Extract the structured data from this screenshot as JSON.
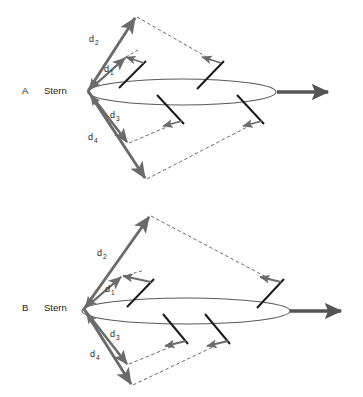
{
  "figure": {
    "background_color": "#ffffff",
    "width": 363,
    "height": 397,
    "colors": {
      "vector_gray": "#6b6b6b",
      "vortex_black": "#1a1a1a",
      "body_outline": "#5a5a5a",
      "dashed_gray": "#6b6b6b",
      "text": "#1a1a1a"
    }
  },
  "panels": [
    {
      "id": "A",
      "label": "A",
      "label_x": 22,
      "label_y": 94,
      "stern_label": "Stern",
      "stern_label_x": 44,
      "stern_label_y": 94,
      "stern_point": {
        "x": 88,
        "y": 91
      },
      "body": {
        "name": "fish-body-ellipse",
        "cx": 182,
        "cy": 92,
        "rx": 94,
        "ry": 13
      },
      "thrust_arrow": {
        "name": "thrust-arrow",
        "x1": 277,
        "y1": 92,
        "x2": 332,
        "y2": 92,
        "label": "thrust"
      },
      "distance_labels": [
        {
          "id": "d1",
          "base": "d",
          "sub": "1",
          "x": 104,
          "y": 72
        },
        {
          "id": "d2",
          "base": "d",
          "sub": "2",
          "x": 90,
          "y": 42
        },
        {
          "id": "d3",
          "base": "d",
          "sub": "3",
          "x": 110,
          "y": 118
        },
        {
          "id": "d4",
          "base": "d",
          "sub": "4",
          "x": 88,
          "y": 140
        }
      ],
      "vectors": [
        {
          "id": "d1",
          "name": "distance-vector-d1",
          "x1": 88,
          "y1": 91,
          "x2": 126,
          "y2": 57
        },
        {
          "id": "d2",
          "name": "distance-vector-d2",
          "x1": 88,
          "y1": 91,
          "x2": 136,
          "y2": 16
        },
        {
          "id": "d3",
          "name": "distance-vector-d3",
          "x1": 88,
          "y1": 91,
          "x2": 128,
          "y2": 143
        },
        {
          "id": "d4",
          "name": "distance-vector-d4",
          "x1": 88,
          "y1": 91,
          "x2": 146,
          "y2": 180
        }
      ],
      "vortex_rings": [
        {
          "id": "ring1",
          "name": "vortex-ring-upper-inner",
          "x1": 120,
          "y1": 87,
          "x2": 145,
          "y2": 63,
          "arrow_x1": 144,
          "arrow_y1": 63,
          "arrow_x2": 124,
          "arrow_y2": 57,
          "dash_x1": 126,
          "dash_y1": 57,
          "dash_x2": 136,
          "dash_y2": 51
        },
        {
          "id": "ring2",
          "name": "vortex-ring-upper-outer",
          "x1": 198,
          "y1": 88,
          "x2": 222,
          "y2": 62,
          "arrow_x1": 220,
          "arrow_y1": 63,
          "arrow_x2": 200,
          "arrow_y2": 58,
          "dash_x1": 136,
          "dash_y1": 16,
          "dash_x2": 211,
          "dash_y2": 60
        },
        {
          "id": "ring3",
          "name": "vortex-ring-lower-inner",
          "x1": 158,
          "y1": 96,
          "x2": 182,
          "y2": 122,
          "arrow_x1": 181,
          "arrow_y1": 121,
          "arrow_x2": 161,
          "arrow_y2": 126,
          "dash_x1": 128,
          "dash_y1": 143,
          "dash_x2": 168,
          "dash_y2": 126
        },
        {
          "id": "ring4",
          "name": "vortex-ring-lower-outer",
          "x1": 238,
          "y1": 96,
          "x2": 262,
          "y2": 122,
          "arrow_x1": 261,
          "arrow_y1": 121,
          "arrow_x2": 241,
          "arrow_y2": 126,
          "dash_x1": 146,
          "dash_y1": 180,
          "dash_x2": 250,
          "dash_y2": 125
        }
      ]
    },
    {
      "id": "B",
      "label": "B",
      "label_x": 22,
      "label_y": 311,
      "stern_label": "Stern",
      "stern_label_x": 44,
      "stern_label_y": 311,
      "stern_point": {
        "x": 84,
        "y": 309
      },
      "body": {
        "name": "fish-body-ellipse",
        "cx": 186,
        "cy": 311,
        "rx": 104,
        "ry": 13
      },
      "thrust_arrow": {
        "name": "thrust-arrow",
        "x1": 290,
        "y1": 311,
        "x2": 345,
        "y2": 311,
        "label": "thrust"
      },
      "distance_labels": [
        {
          "id": "d1",
          "base": "d",
          "sub": "1",
          "x": 106,
          "y": 292
        },
        {
          "id": "d2",
          "base": "d",
          "sub": "2",
          "x": 98,
          "y": 256
        },
        {
          "id": "d3",
          "base": "d",
          "sub": "3",
          "x": 110,
          "y": 337
        },
        {
          "id": "d4",
          "base": "d",
          "sub": "4",
          "x": 90,
          "y": 357
        }
      ],
      "vectors": [
        {
          "id": "d1",
          "name": "distance-vector-d1",
          "x1": 84,
          "y1": 309,
          "x2": 122,
          "y2": 276
        },
        {
          "id": "d2",
          "name": "distance-vector-d2",
          "x1": 84,
          "y1": 309,
          "x2": 150,
          "y2": 215
        },
        {
          "id": "d3",
          "name": "distance-vector-d3",
          "x1": 84,
          "y1": 309,
          "x2": 128,
          "y2": 365
        },
        {
          "id": "d4",
          "name": "distance-vector-d4",
          "x1": 84,
          "y1": 309,
          "x2": 132,
          "y2": 386
        }
      ],
      "vortex_rings": [
        {
          "id": "ring1",
          "name": "vortex-ring-upper-inner",
          "x1": 128,
          "y1": 306,
          "x2": 152,
          "y2": 281,
          "arrow_x1": 150,
          "arrow_y1": 282,
          "arrow_x2": 121,
          "arrow_y2": 276,
          "dash_x1": 122,
          "dash_y1": 276,
          "dash_x2": 140,
          "dash_y2": 272
        },
        {
          "id": "ring2",
          "name": "vortex-ring-upper-outer",
          "x1": 258,
          "y1": 307,
          "x2": 282,
          "y2": 281,
          "arrow_x1": 280,
          "arrow_y1": 282,
          "arrow_x2": 258,
          "arrow_y2": 278,
          "dash_x1": 150,
          "dash_y1": 215,
          "dash_x2": 271,
          "dash_y2": 280
        },
        {
          "id": "ring3",
          "name": "vortex-ring-lower-inner",
          "x1": 164,
          "y1": 316,
          "x2": 186,
          "y2": 342,
          "arrow_x1": 185,
          "arrow_y1": 341,
          "arrow_x2": 163,
          "arrow_y2": 346,
          "dash_x1": 128,
          "dash_y1": 365,
          "dash_x2": 172,
          "dash_y2": 346
        },
        {
          "id": "ring4",
          "name": "vortex-ring-lower-outer",
          "x1": 206,
          "y1": 316,
          "x2": 228,
          "y2": 342,
          "arrow_x1": 227,
          "arrow_y1": 341,
          "arrow_x2": 205,
          "arrow_y2": 346,
          "dash_x1": 132,
          "dash_y1": 386,
          "dash_x2": 214,
          "dash_y2": 346
        }
      ]
    }
  ]
}
